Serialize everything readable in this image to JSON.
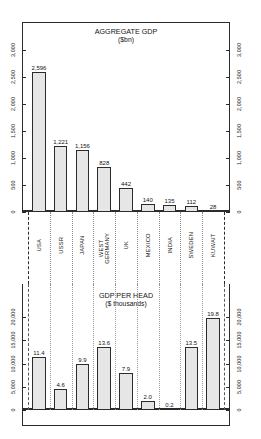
{
  "chart_data": [
    {
      "type": "bar",
      "title": "AGGREGATE GDP",
      "subtitle": "($bn)",
      "xlabel": "",
      "ylabel": "",
      "ylim": [
        0,
        3000
      ],
      "yticks": [
        "0",
        "500",
        "1,000",
        "1,500",
        "2,000",
        "2,500",
        "3,000"
      ],
      "grid": false,
      "legend": "none",
      "axis_right_mirrored": true,
      "categories": [
        "USA",
        "USSR",
        "JAPAN",
        "WEST GERMANY",
        "UK",
        "MEXICO",
        "INDIA",
        "SWEDEN",
        "KUWAIT"
      ],
      "values": [
        2596,
        1221,
        1156,
        828,
        442,
        140,
        135,
        112,
        28
      ],
      "value_labels": [
        "2,596",
        "1,221",
        "1,156",
        "828",
        "442",
        "140",
        "135",
        "112",
        "28"
      ]
    },
    {
      "type": "bar",
      "title": "GDP PER HEAD",
      "subtitle": "($ thousands)",
      "xlabel": "",
      "ylabel": "",
      "ylim": [
        0,
        22000
      ],
      "yticks": [
        "0",
        "5,000",
        "10,000",
        "15,000",
        "20,000"
      ],
      "grid": false,
      "legend": "none",
      "axis_right_mirrored": true,
      "categories": [
        "USA",
        "USSR",
        "JAPAN",
        "WEST GERMANY",
        "UK",
        "MEXICO",
        "INDIA",
        "SWEDEN",
        "KUWAIT"
      ],
      "values": [
        11400,
        4600,
        9900,
        13600,
        7900,
        2000,
        200,
        13500,
        19800
      ],
      "value_labels": [
        "11.4",
        "4.6",
        "9.9",
        "13.6",
        "7.9",
        "2.0",
        "0.2",
        "13.5",
        "19.8"
      ]
    }
  ],
  "categories": {
    "items": [
      {
        "lines": [
          "USA"
        ]
      },
      {
        "lines": [
          "USSR"
        ]
      },
      {
        "lines": [
          "JAPAN"
        ]
      },
      {
        "lines": [
          "WEST",
          "GERMANY"
        ]
      },
      {
        "lines": [
          "UK"
        ]
      },
      {
        "lines": [
          "MEXICO"
        ]
      },
      {
        "lines": [
          "INDIA"
        ]
      },
      {
        "lines": [
          "SWEDEN"
        ]
      },
      {
        "lines": [
          "KUWAIT"
        ]
      }
    ]
  },
  "colors": {
    "ink": "#2b2b2b",
    "bar_fill": "#d8d8d8",
    "bar_hatch": "#8f8f8f",
    "background": "#ffffff"
  }
}
